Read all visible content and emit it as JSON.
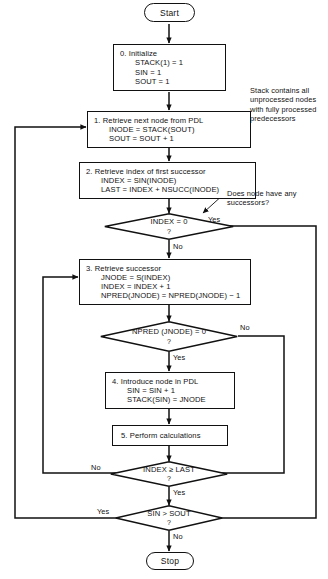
{
  "diagram": {
    "colors": {
      "line": "#111111",
      "background": "#ffffff",
      "text": "#111111"
    }
  },
  "terminators": {
    "start": "Start",
    "stop": "Stop"
  },
  "steps": {
    "step0": {
      "title": "0.  Initialize",
      "l1": "STACK(1) = 1",
      "l2": "SIN  = 1",
      "l3": "SOUT = 1"
    },
    "step1": {
      "title": "1.  Retrieve next node from PDL",
      "l1": "INODE = STACK(SOUT)",
      "l2": "SOUT = SOUT + 1"
    },
    "step2": {
      "title": "2.  Retrieve index of first successor",
      "l1": "INDEX = SIN(INODE)",
      "l2": "LAST = INDEX + NSUCC(INODE)"
    },
    "step3": {
      "title": "3.  Retrieve successor",
      "l1": "JNODE = S(INDEX)",
      "l2": "INDEX = INDEX + 1",
      "l3": "NPRED(JNODE) = NPRED(JNODE) − 1"
    },
    "step4": {
      "title": "4.  Introduce node in PDL",
      "l1": "SIN = SIN + 1",
      "l2": "STACK(SIN) = JNODE"
    },
    "step5": {
      "title": "5.  Perform calculations"
    }
  },
  "decisions": {
    "d1": {
      "text": "INDEX = 0",
      "question": "?",
      "yes": "Yes",
      "no": "No"
    },
    "d2": {
      "text": "NPRED (JNODE) = 0",
      "question": "?",
      "yes": "Yes",
      "no": "No"
    },
    "d3": {
      "text": "INDEX ≥ LAST",
      "question": "?",
      "yes": "Yes",
      "no": "No"
    },
    "d4": {
      "text": "SIN > SOUT",
      "question": "?",
      "yes": "Yes",
      "no": "No"
    }
  },
  "annotations": {
    "successors_note": "Does node have any successors?",
    "stack_note": "Stack contains all\nunprocessed nodes\nwith fully processed\npredecessors"
  }
}
